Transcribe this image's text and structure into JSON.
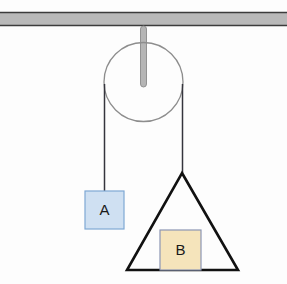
{
  "figure": {
    "background_color": "#fdfdfd",
    "width": 287,
    "height": 284
  },
  "ceiling": {
    "name": "ceiling-beam",
    "fill_color": "#b9b9b9",
    "edge_color": "#3c3c3c",
    "x": 0,
    "y": 12,
    "width": 287,
    "height": 14
  },
  "rod": {
    "name": "pulley-support-rod",
    "fill_color": "#b5b5b5",
    "edge_color": "#8a8a8a",
    "x": 140.5,
    "y": 26,
    "width": 6,
    "height": 61
  },
  "pulley": {
    "name": "pulley-wheel",
    "stroke_color": "#8d8d8d",
    "fill_color": "none",
    "center_x": 143.5,
    "center_y": 82,
    "radius": 39.5
  },
  "ropes": [
    {
      "name": "rope-left",
      "stroke_color": "#35353d",
      "x1": 104.5,
      "y1": 84,
      "x2": 104.5,
      "y2": 191
    },
    {
      "name": "rope-right",
      "stroke_color": "#35353d",
      "x1": 182.5,
      "y1": 84,
      "x2": 182.5,
      "y2": 173
    }
  ],
  "triangle": {
    "name": "triangle-wedge",
    "stroke_color": "#111111",
    "fill_color": "none",
    "apex_x": 182,
    "apex_y": 173,
    "base_left_x": 127,
    "base_right_x": 238,
    "base_y": 270
  },
  "blocks": [
    {
      "name": "block-a",
      "label": "A",
      "fill_color": "#cfe0f2",
      "edge_color": "#7fa8d4",
      "x": 85,
      "y": 191,
      "width": 39,
      "height": 38
    },
    {
      "name": "block-b",
      "label": "B",
      "fill_color": "#f5e4bb",
      "edge_color": "#8c96b4",
      "x": 160,
      "y": 230,
      "width": 41,
      "height": 40
    }
  ]
}
